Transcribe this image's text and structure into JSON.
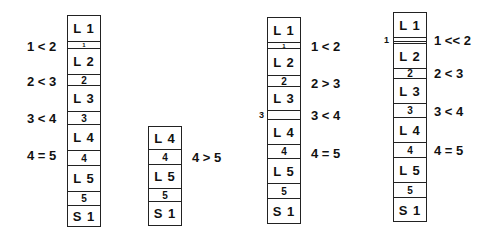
{
  "columns": [
    {
      "id": "spine-a",
      "segments": [
        {
          "type": "vertebra",
          "label": "L 1",
          "top": 0,
          "h": 26
        },
        {
          "type": "disc",
          "label": "1",
          "top": 26,
          "h": 7,
          "size": "tiny"
        },
        {
          "type": "vertebra",
          "label": "L 2",
          "top": 33,
          "h": 26
        },
        {
          "type": "disc",
          "label": "2",
          "top": 59,
          "h": 11
        },
        {
          "type": "vertebra",
          "label": "L 3",
          "top": 70,
          "h": 26
        },
        {
          "type": "disc",
          "label": "3",
          "top": 96,
          "h": 13
        },
        {
          "type": "vertebra",
          "label": "L 4",
          "top": 109,
          "h": 26
        },
        {
          "type": "disc",
          "label": "4",
          "top": 135,
          "h": 15
        },
        {
          "type": "vertebra",
          "label": "L 5",
          "top": 150,
          "h": 26
        },
        {
          "type": "disc",
          "label": "5",
          "top": 176,
          "h": 14
        },
        {
          "type": "vertebra",
          "label": "S 1",
          "top": 190,
          "h": 21
        }
      ],
      "comparisons": [
        "1 < 2",
        "2 < 3",
        "3 < 4",
        "4 = 5"
      ]
    },
    {
      "id": "spine-b",
      "segments": [
        {
          "type": "vertebra",
          "label": "L 4",
          "top": 0,
          "h": 23
        },
        {
          "type": "disc",
          "label": "4",
          "top": 23,
          "h": 15
        },
        {
          "type": "vertebra",
          "label": "L 5",
          "top": 38,
          "h": 24
        },
        {
          "type": "disc",
          "label": "5",
          "top": 62,
          "h": 13
        },
        {
          "type": "vertebra",
          "label": "S 1",
          "top": 75,
          "h": 24
        }
      ],
      "comparisons": [
        "4 > 5"
      ]
    },
    {
      "id": "spine-c",
      "segments": [
        {
          "type": "vertebra",
          "label": "L 1",
          "top": 0,
          "h": 25
        },
        {
          "type": "disc",
          "label": "1",
          "top": 25,
          "h": 6,
          "size": "tiny"
        },
        {
          "type": "vertebra",
          "label": "L 2",
          "top": 31,
          "h": 27
        },
        {
          "type": "disc",
          "label": "2",
          "top": 58,
          "h": 11
        },
        {
          "type": "vertebra",
          "label": "L 3",
          "top": 69,
          "h": 24
        },
        {
          "type": "disc",
          "label": "",
          "top": 93,
          "h": 9
        },
        {
          "type": "vertebra",
          "label": "L 4",
          "top": 102,
          "h": 25
        },
        {
          "type": "disc",
          "label": "4",
          "top": 127,
          "h": 14
        },
        {
          "type": "vertebra",
          "label": "L 5",
          "top": 141,
          "h": 25
        },
        {
          "type": "disc",
          "label": "5",
          "top": 166,
          "h": 15
        },
        {
          "type": "vertebra",
          "label": "S 1",
          "top": 181,
          "h": 25
        }
      ],
      "side_label": "3",
      "comparisons": [
        "1 < 2",
        "2 > 3",
        "3 < 4",
        "4 = 5"
      ]
    },
    {
      "id": "spine-d",
      "segments": [
        {
          "type": "vertebra",
          "label": "L 1",
          "top": 0,
          "h": 25
        },
        {
          "type": "disc",
          "label": "",
          "top": 25,
          "h": 6,
          "style": "double"
        },
        {
          "type": "vertebra",
          "label": "L 2",
          "top": 31,
          "h": 25
        },
        {
          "type": "disc",
          "label": "2",
          "top": 56,
          "h": 10
        },
        {
          "type": "vertebra",
          "label": "L 3",
          "top": 66,
          "h": 25
        },
        {
          "type": "disc",
          "label": "3",
          "top": 91,
          "h": 14
        },
        {
          "type": "vertebra",
          "label": "L 4",
          "top": 105,
          "h": 25
        },
        {
          "type": "disc",
          "label": "4",
          "top": 130,
          "h": 15
        },
        {
          "type": "vertebra",
          "label": "L 5",
          "top": 145,
          "h": 25
        },
        {
          "type": "disc",
          "label": "5",
          "top": 170,
          "h": 15
        },
        {
          "type": "vertebra",
          "label": "S 1",
          "top": 185,
          "h": 24
        }
      ],
      "side_label": "1",
      "comparisons": [
        "1 << 2",
        "2 < 3",
        "3 < 4",
        "4 = 5"
      ]
    }
  ]
}
